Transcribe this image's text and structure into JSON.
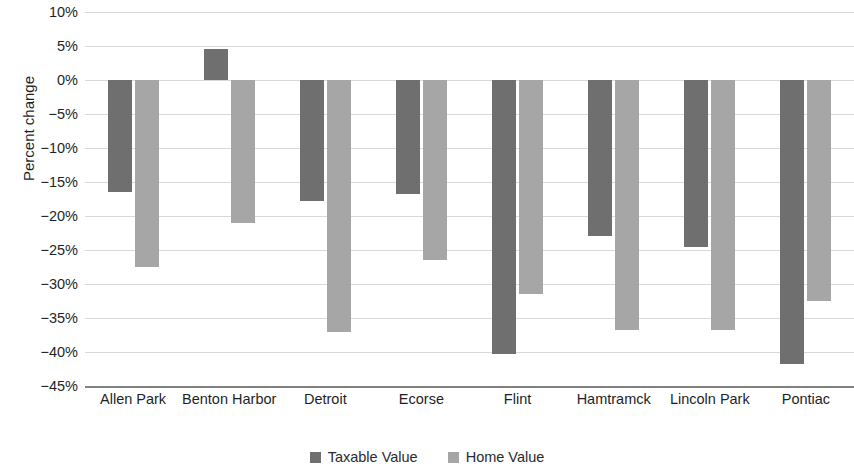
{
  "chart_data": {
    "type": "bar",
    "title": "",
    "xlabel": "",
    "ylabel": "Percent change",
    "ylim": [
      -45,
      10
    ],
    "ytick_step": 5,
    "grid": true,
    "legend_position": "bottom",
    "categories": [
      "Allen Park",
      "Benton Harbor",
      "Detroit",
      "Ecorse",
      "Flint",
      "Hamtramck",
      "Lincoln Park",
      "Pontiac"
    ],
    "ytick_labels": [
      "10%",
      "5%",
      "0%",
      "−5%",
      "−10%",
      "−15%",
      "−20%",
      "−25%",
      "−30%",
      "−35%",
      "−40%",
      "−45%"
    ],
    "ytick_values": [
      10,
      5,
      0,
      -5,
      -10,
      -15,
      -20,
      -25,
      -30,
      -35,
      -40,
      -45
    ],
    "series": [
      {
        "name": "Taxable Value",
        "color": "#6f6f6f",
        "values": [
          -16.5,
          4.6,
          -17.8,
          -16.8,
          -40.3,
          -23.0,
          -24.5,
          -41.8
        ]
      },
      {
        "name": "Home Value",
        "color": "#a6a6a6",
        "values": [
          -27.5,
          -21.0,
          -37.0,
          -26.5,
          -31.5,
          -36.7,
          -36.7,
          -32.5
        ]
      }
    ]
  },
  "legend": {
    "items": [
      {
        "label": "Taxable Value"
      },
      {
        "label": "Home Value"
      }
    ]
  },
  "colors": {
    "taxable": "#6f6f6f",
    "home": "#a6a6a6",
    "gridline": "#d9d9d9",
    "baseline": "#808080",
    "text": "#1f1f1f"
  }
}
